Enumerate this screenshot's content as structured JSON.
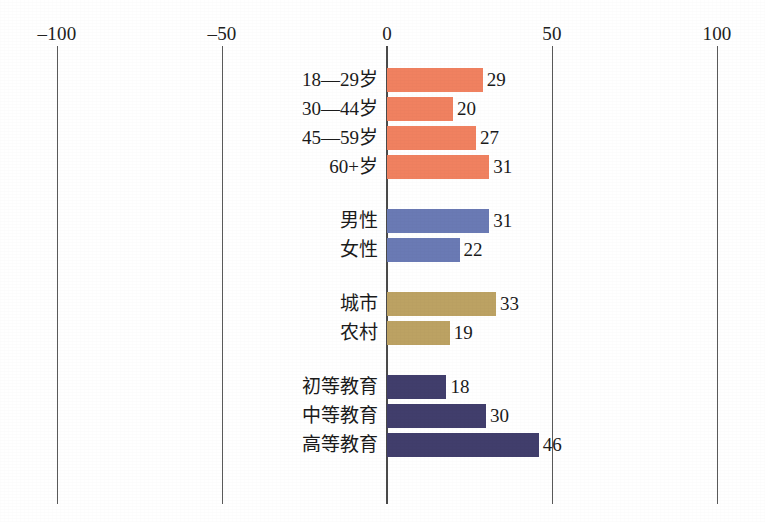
{
  "chart_data": {
    "type": "bar",
    "orientation": "horizontal",
    "title": "",
    "subtitle": "",
    "xlabel": "",
    "ylabel": "",
    "xlim": [
      -100,
      100
    ],
    "xticks": [
      -100,
      -50,
      0,
      50,
      100
    ],
    "xtick_labels": [
      "–100",
      "–50",
      "0",
      "50",
      "100"
    ],
    "grid": false,
    "legend": "none",
    "zero_axis": 0,
    "groups": [
      {
        "name": "age",
        "color": "#F08160",
        "items": [
          {
            "label": "18—29岁",
            "value": 29
          },
          {
            "label": "30—44岁",
            "value": 20
          },
          {
            "label": "45—59岁",
            "value": 27
          },
          {
            "label": "60+岁",
            "value": 31
          }
        ]
      },
      {
        "name": "gender",
        "color": "#6A7AB4",
        "items": [
          {
            "label": "男性",
            "value": 31
          },
          {
            "label": "女性",
            "value": 22
          }
        ]
      },
      {
        "name": "residence",
        "color": "#BCA263",
        "items": [
          {
            "label": "城市",
            "value": 33
          },
          {
            "label": "农村",
            "value": 19
          }
        ]
      },
      {
        "name": "education",
        "color": "#413E6C",
        "items": [
          {
            "label": "初等教育",
            "value": 18
          },
          {
            "label": "中等教育",
            "value": 30
          },
          {
            "label": "高等教育",
            "value": 46
          }
        ]
      }
    ],
    "categories": [
      "18—29岁",
      "30—44岁",
      "45—59岁",
      "60+岁",
      "男性",
      "女性",
      "城市",
      "农村",
      "初等教育",
      "中等教育",
      "高等教育"
    ],
    "values": [
      29,
      20,
      27,
      31,
      31,
      22,
      33,
      19,
      18,
      30,
      46
    ]
  },
  "layout": {
    "zero_x_px": 387,
    "px_per_unit": 3.3,
    "tick_mark_top_px": 46,
    "tick_mark_height_px": 458,
    "tick_label_y_px": 24,
    "row_height_px": 26,
    "row_gap_px": 3,
    "group_gap_px": 25,
    "first_row_top_px": 67
  },
  "colors": {
    "orange": "#F08160",
    "blue": "#6A7AB4",
    "khaki": "#BCA263",
    "navy": "#413E6C",
    "axis": "#4a4a4a",
    "tick": "#5a5a5a",
    "text": "#1b1b1b",
    "background": "#ffffff"
  }
}
